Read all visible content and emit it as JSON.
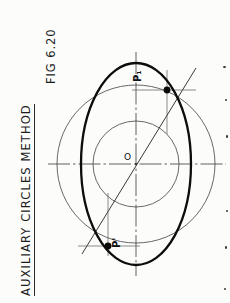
{
  "figure": {
    "title": "AUXILIARY  CIRCLES   METHOD",
    "fig_number": "FIG 6.20",
    "title_underlined": true,
    "orientation": "rotated-90-ccw"
  },
  "diagram": {
    "type": "engineering-construction-ellipse",
    "center_label": "O",
    "point_labels": {
      "upper": "P₁",
      "lower": "P'"
    },
    "colors": {
      "ink": "#101010",
      "construction": "#4a4a4a",
      "paper": "#fcfcfb",
      "ellipse_stroke": "#0d0d0d"
    },
    "geometry": {
      "center": {
        "x": 136,
        "y": 164
      },
      "major_circle_radius": 79,
      "minor_circle_radius": 43,
      "ellipse_semi_major_vertical": 101,
      "ellipse_semi_minor_horizontal": 55,
      "radial_line_angle_deg": 57,
      "axis_horizontal_y": 164,
      "axis_vertical_x": 136
    },
    "elements": [
      {
        "name": "major-auxiliary-circle",
        "kind": "circle",
        "weight": "thin"
      },
      {
        "name": "minor-auxiliary-circle",
        "kind": "circle",
        "weight": "thin"
      },
      {
        "name": "ellipse",
        "kind": "ellipse",
        "weight": "heavy"
      },
      {
        "name": "horizontal-centre-line",
        "kind": "chain-line"
      },
      {
        "name": "vertical-centre-line",
        "kind": "chain-line"
      },
      {
        "name": "radial-construction-line",
        "kind": "line"
      },
      {
        "name": "projector-upper-vertical",
        "kind": "thin-line"
      },
      {
        "name": "projector-upper-horizontal",
        "kind": "thin-line"
      },
      {
        "name": "projector-lower-vertical",
        "kind": "thin-line"
      },
      {
        "name": "projector-lower-horizontal",
        "kind": "thin-line"
      },
      {
        "name": "point-marker-upper",
        "kind": "dot"
      },
      {
        "name": "point-marker-lower",
        "kind": "dot"
      }
    ]
  }
}
